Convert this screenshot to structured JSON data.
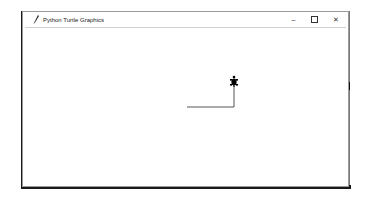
{
  "window": {
    "title": "Python Turtle Graphics",
    "app_icon": "feather-icon",
    "controls": {
      "minimize": "–",
      "maximize": "☐",
      "close": "✕"
    }
  },
  "canvas": {
    "background": "#ffffff",
    "pen_color": "#555555",
    "turtle_color": "#000000",
    "drawing": {
      "segments": [
        {
          "name": "horizontal-line",
          "direction": "east"
        },
        {
          "name": "vertical-line",
          "direction": "north"
        }
      ],
      "turtle_heading": "north"
    }
  }
}
